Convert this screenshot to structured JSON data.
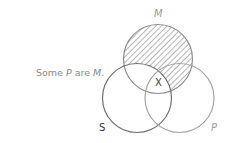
{
  "caption": {
    "prefix": "Some ",
    "term1": "P",
    "middle": " are ",
    "term2": "M",
    "suffix": "."
  },
  "diagram": {
    "type": "venn-3-circle",
    "circles": [
      {
        "id": "M",
        "label": "M",
        "cx": 158,
        "cy": 59,
        "r": 34.5,
        "stroke": "#8f8f8f"
      },
      {
        "id": "S",
        "label": "S",
        "cx": 137,
        "cy": 98,
        "r": 34.5,
        "stroke": "#6f6f6f"
      },
      {
        "id": "P",
        "label": "P",
        "cx": 179.5,
        "cy": 98,
        "r": 34.5,
        "stroke": "#a5a5a5"
      }
    ],
    "shaded_region": "M outside S",
    "marker": {
      "text": "X",
      "region": "M ∩ S ∩ P"
    },
    "label_colors": {
      "M": "#9a9a9a",
      "S": "#333333",
      "P": "#a0a0a0"
    }
  }
}
